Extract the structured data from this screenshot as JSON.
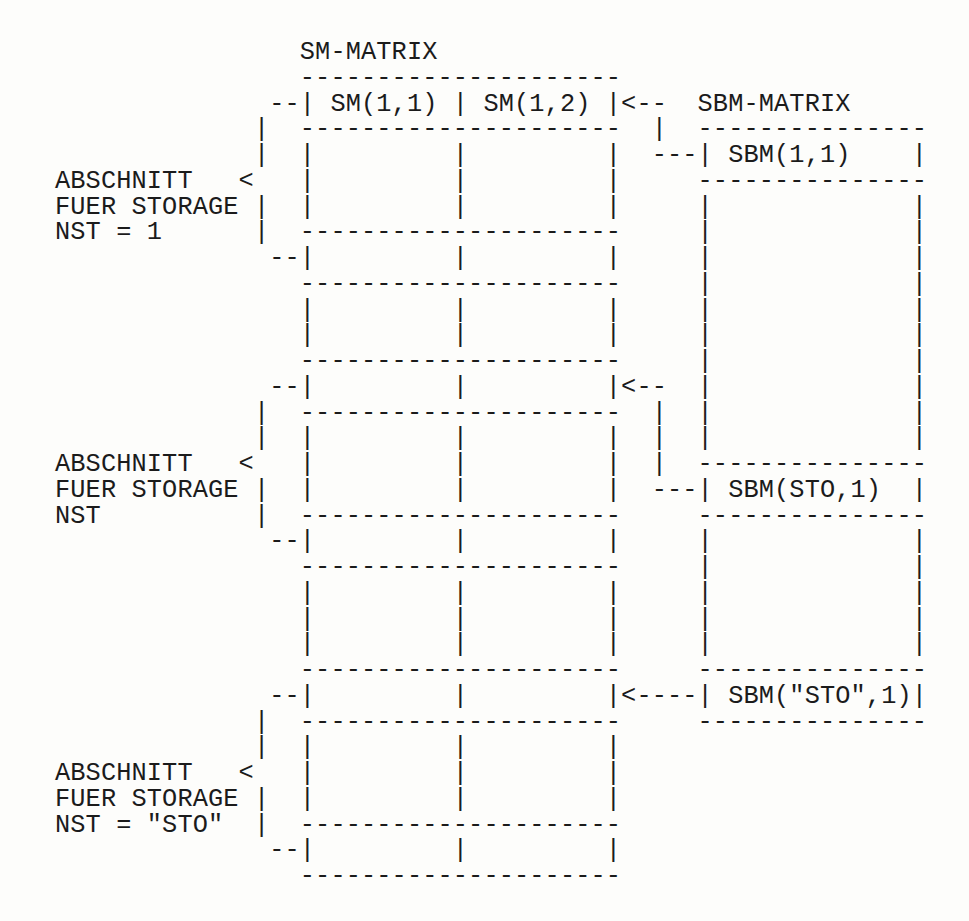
{
  "title": "SM-MATRIX",
  "sbm_title": "SBM-MATRIX",
  "sm_cells": [
    "SM(1,1)",
    "SM(1,2)"
  ],
  "sbm_cells": [
    "SBM(1,1)",
    "SBM(STO,1)",
    "SBM(\"STO\",1)"
  ],
  "sections": [
    {
      "line1": "ABSCHNITT",
      "line2": "FUER STORAGE",
      "line3": "NST = 1"
    },
    {
      "line1": "ABSCHNITT",
      "line2": "FUER STORAGE",
      "line3": "NST"
    },
    {
      "line1": "ABSCHNITT",
      "line2": "FUER STORAGE",
      "line3": "NST = \"STO\""
    }
  ],
  "ascii_rows": [
    "                SM-MATRIX",
    "                ---------------------",
    "              --| SM(1,1) | SM(1,2) |<--  SBM-MATRIX",
    "             |  ---------------------  |  ---------------",
    "             |  |         |         |  ---| SBM(1,1)    |",
    "ABSCHNITT   <   |         |         |     ---------------",
    "FUER STORAGE |  |         |         |     |             |",
    "NST = 1      |  ---------------------     |             |",
    "              --|         |         |     |             |",
    "                ---------------------     |             |",
    "                |         |         |     |             |",
    "                |         |         |     |             |",
    "                ---------------------     |             |",
    "              --|         |         |<--  |             |",
    "             |  ---------------------  |  |             |",
    "             |  |         |         |  |  |             |",
    "ABSCHNITT   <   |         |         |  |  ---------------",
    "FUER STORAGE |  |         |         |  ---| SBM(STO,1)  |",
    "NST          |  ---------------------     ---------------",
    "              --|         |         |     |             |",
    "                ---------------------     |             |",
    "                |         |         |     |             |",
    "                |         |         |     |             |",
    "                |         |         |     |             |",
    "                ---------------------     ---------------",
    "              --|         |         |<----| SBM(\"STO\",1)|",
    "             |  ---------------------     ---------------",
    "             |  |         |         |",
    "ABSCHNITT   <   |         |         |",
    "FUER STORAGE |  |         |         |",
    "NST = \"STO\"  |  ---------------------",
    "              --|         |         |",
    "                ---------------------"
  ]
}
